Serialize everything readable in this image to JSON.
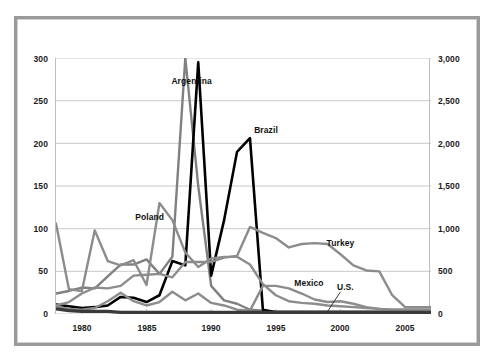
{
  "chart_data": {
    "type": "line",
    "title": "",
    "subtitle": "",
    "xlabel": "",
    "ylabel": "",
    "y2label": "",
    "xlim": [
      1978,
      2007
    ],
    "ylim": [
      0,
      300
    ],
    "y2lim": [
      0,
      3000
    ],
    "grid": true,
    "legend_position": "inline-annotations",
    "x_ticks": [
      "1980",
      "1985",
      "1990",
      "1995",
      "2000",
      "2005"
    ],
    "x_tick_values": [
      1980,
      1985,
      1990,
      1995,
      2000,
      2005
    ],
    "y_ticks_left": [
      "0",
      "50",
      "100",
      "150",
      "200",
      "250",
      "300"
    ],
    "y_tick_values_left": [
      0,
      50,
      100,
      150,
      200,
      250,
      300
    ],
    "y_ticks_right": [
      "0",
      "500",
      "1,000",
      "1,500",
      "2,000",
      "2,500",
      "3,000"
    ],
    "y_tick_values_right": [
      0,
      500,
      1000,
      1500,
      2000,
      2500,
      3000
    ],
    "x": [
      1978,
      1979,
      1980,
      1981,
      1982,
      1983,
      1984,
      1985,
      1986,
      1987,
      1988,
      1989,
      1990,
      1991,
      1992,
      1993,
      1994,
      1995,
      1996,
      1997,
      1998,
      1999,
      2000,
      2001,
      2002,
      2003,
      2004,
      2005,
      2006,
      2007
    ],
    "series": [
      {
        "name": "Argentina",
        "color": "#808080",
        "width": 2.4,
        "label_x": 1987.0,
        "label_y": 272,
        "values": [
          24,
          27,
          31,
          30,
          44,
          58,
          58,
          64,
          47,
          67,
          300,
          150,
          33,
          16,
          12,
          5,
          4,
          3,
          3,
          3,
          3,
          3,
          3,
          3,
          3,
          3,
          3,
          3,
          3,
          3
        ]
      },
      {
        "name": "Brazil",
        "color": "#000000",
        "width": 2.6,
        "label_x": 1993.4,
        "label_y": 214,
        "values": [
          11,
          9,
          7,
          8,
          10,
          20,
          19,
          14,
          22,
          62,
          57,
          295,
          45,
          110,
          190,
          206,
          5,
          2,
          1,
          1,
          1,
          1,
          1,
          1,
          1,
          1,
          1,
          1,
          1,
          1
        ]
      },
      {
        "name": "Poland",
        "color": "#8c8c8c",
        "width": 2.4,
        "label_x": 1984.2,
        "label_y": 112,
        "values": [
          106,
          29,
          27,
          98,
          62,
          57,
          63,
          34,
          130,
          110,
          72,
          55,
          65,
          67,
          67,
          58,
          35,
          22,
          15,
          13,
          12,
          10,
          9,
          8,
          7,
          6,
          5,
          5,
          5,
          5
        ]
      },
      {
        "name": "Turkey",
        "color": "#8c8c8c",
        "width": 2.4,
        "label_x": 1999.0,
        "label_y": 82,
        "values": [
          10,
          14,
          24,
          31,
          30,
          33,
          45,
          46,
          47,
          43,
          61,
          61,
          61,
          66,
          68,
          102,
          95,
          89,
          78,
          82,
          83,
          82,
          70,
          57,
          51,
          50,
          22,
          8,
          8,
          8
        ]
      },
      {
        "name": "Mexico",
        "color": "#8c8c8c",
        "width": 2.4,
        "label_x": 1996.5,
        "label_y": 35,
        "values": [
          9,
          6,
          5,
          7,
          15,
          25,
          15,
          10,
          14,
          26,
          16,
          24,
          13,
          10,
          5,
          4,
          33,
          33,
          30,
          24,
          17,
          14,
          15,
          12,
          8,
          6,
          5,
          5,
          5,
          5
        ]
      },
      {
        "name": "U.S.",
        "color": "#3a3a3a",
        "width": 3.2,
        "label_x": 1999.8,
        "label_y": 30,
        "values": [
          6,
          4,
          3,
          3,
          3,
          2,
          2,
          2,
          2,
          2,
          2,
          2,
          2,
          2,
          2,
          2,
          2,
          2,
          2,
          2,
          2,
          2,
          2,
          2,
          2,
          2,
          2,
          2,
          2,
          2
        ]
      }
    ],
    "annotations": [
      {
        "text": "U.S.",
        "leader_from_x": 2000.0,
        "leader_from_y": 26,
        "leader_to_x": 1999.0,
        "leader_to_y": 3
      }
    ]
  },
  "axes": {
    "left_ticks": [
      "300",
      "250",
      "200",
      "150",
      "100",
      "50",
      "0"
    ],
    "right_ticks": [
      "3,000",
      "2,500",
      "2,000",
      "1,500",
      "1,000",
      "500",
      "0"
    ],
    "x_ticks": [
      "1980",
      "1985",
      "1990",
      "1995",
      "2000",
      "2005"
    ]
  },
  "labels": {
    "argentina": "Argentina",
    "brazil": "Brazil",
    "poland": "Poland",
    "turkey": "Turkey",
    "mexico": "Mexico",
    "us": "U.S."
  },
  "colors": {
    "gray_series": "#8c8c8c",
    "black_series": "#000000",
    "us_series": "#3a3a3a",
    "grid": "#c9c9c9",
    "frame": "#9a9a9a",
    "text": "#111111",
    "background": "#ffffff"
  }
}
